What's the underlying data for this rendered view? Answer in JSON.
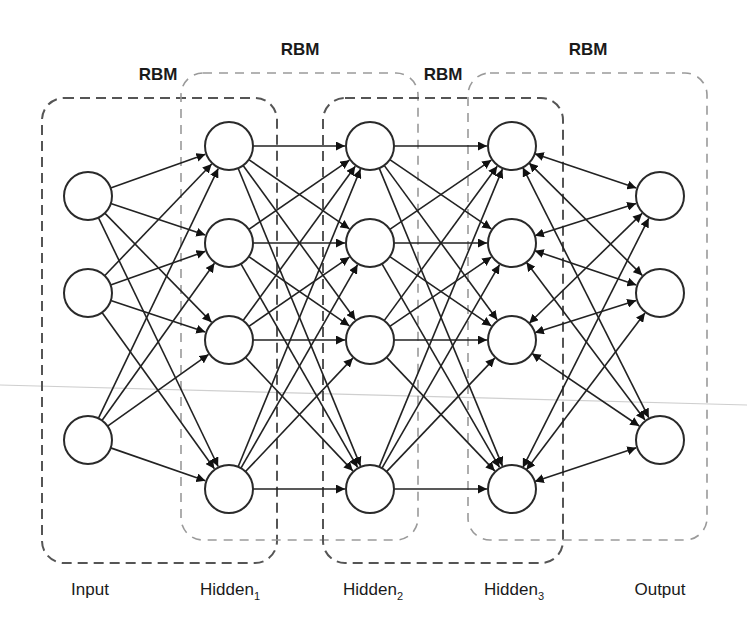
{
  "diagram": {
    "rbm_labels": [
      {
        "text": "RBM",
        "x": 158,
        "y": 80
      },
      {
        "text": "RBM",
        "x": 300,
        "y": 55
      },
      {
        "text": "RBM",
        "x": 443,
        "y": 80
      },
      {
        "text": "RBM",
        "x": 588,
        "y": 55
      }
    ],
    "layers": [
      {
        "id": "input",
        "label": "Input",
        "sub": "",
        "x": 88,
        "label_x": 90,
        "nodes_y": [
          196,
          293,
          440
        ]
      },
      {
        "id": "hidden1",
        "label": "Hidden",
        "sub": "1",
        "x": 229,
        "label_x": 230,
        "nodes_y": [
          146,
          243,
          340,
          489
        ]
      },
      {
        "id": "hidden2",
        "label": "Hidden",
        "sub": "2",
        "x": 370,
        "label_x": 373,
        "nodes_y": [
          146,
          243,
          340,
          489
        ]
      },
      {
        "id": "hidden3",
        "label": "Hidden",
        "sub": "3",
        "x": 512,
        "label_x": 514,
        "nodes_y": [
          146,
          243,
          340,
          489
        ]
      },
      {
        "id": "output",
        "label": "Output",
        "sub": "",
        "x": 660,
        "label_x": 660,
        "nodes_y": [
          196,
          293,
          440
        ]
      }
    ],
    "connections": [
      {
        "from": "input",
        "to": "hidden1",
        "type": "directed"
      },
      {
        "from": "hidden1",
        "to": "hidden2",
        "type": "directed"
      },
      {
        "from": "hidden2",
        "to": "hidden3",
        "type": "directed"
      },
      {
        "from": "hidden3",
        "to": "output",
        "type": "bidirectional"
      }
    ],
    "rbm_boxes": [
      {
        "name": "rbm-input-hidden1",
        "style": "dark",
        "x": 42,
        "y": 98,
        "w": 235,
        "h": 465
      },
      {
        "name": "rbm-hidden1-hidden2",
        "style": "light",
        "x": 181,
        "y": 73,
        "w": 237,
        "h": 467
      },
      {
        "name": "rbm-hidden2-hidden3",
        "style": "dark",
        "x": 323,
        "y": 98,
        "w": 240,
        "h": 465
      },
      {
        "name": "rbm-hidden3-output",
        "style": "light",
        "x": 468,
        "y": 73,
        "w": 239,
        "h": 467
      }
    ],
    "node_radius": 24,
    "label_y": 595,
    "colors": {
      "stroke": "#222222",
      "box_dark": "#555555",
      "box_light": "#9a9a9a",
      "background": "#ffffff"
    }
  }
}
